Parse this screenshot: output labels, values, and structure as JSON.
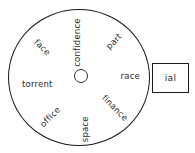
{
  "diagram": {
    "type": "word-wheel",
    "background_color": "#ffffff",
    "stroke_color": "#1a1a1a",
    "text_color": "#2b2b2b",
    "wheel": {
      "center_x": 81,
      "center_y": 76,
      "radius_x": 71,
      "radius_y": 68,
      "hub_radius": 7
    },
    "spokes": [
      {
        "label": "confidence",
        "angle_deg": -90,
        "radius": 62,
        "flip": false
      },
      {
        "label": "part",
        "angle_deg": -45,
        "radius": 60,
        "flip": false
      },
      {
        "label": "race",
        "angle_deg": 0,
        "radius": 59,
        "flip": false
      },
      {
        "label": "finance",
        "angle_deg": 45,
        "radius": 60,
        "flip": false
      },
      {
        "label": "space",
        "angle_deg": 90,
        "radius": 62,
        "flip": true
      },
      {
        "label": "office",
        "angle_deg": 135,
        "radius": 60,
        "flip": true
      },
      {
        "label": "torrent",
        "angle_deg": 180,
        "radius": 59,
        "flip": true
      },
      {
        "label": "face",
        "angle_deg": -135,
        "radius": 60,
        "flip": true
      }
    ],
    "suffix_box": {
      "text": "ial",
      "x": 152,
      "y": 63,
      "width": 37,
      "height": 30
    }
  }
}
